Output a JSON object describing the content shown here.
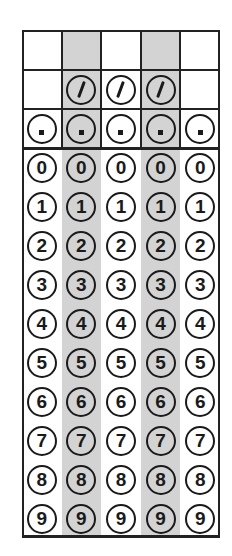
{
  "grid": {
    "columns": 5,
    "shaded_columns": [
      1,
      3
    ],
    "shade_color": "#d3d3d3",
    "line_color": "#222222",
    "answer_boxes": [
      "",
      "",
      "",
      "",
      ""
    ],
    "slash_row": {
      "symbol": "/",
      "columns": [
        1,
        2,
        3
      ]
    },
    "dot_row": {
      "symbol": ".",
      "columns": [
        0,
        1,
        2,
        3,
        4
      ]
    },
    "digit_rows": [
      "0",
      "1",
      "2",
      "3",
      "4",
      "5",
      "6",
      "7",
      "8",
      "9"
    ]
  }
}
